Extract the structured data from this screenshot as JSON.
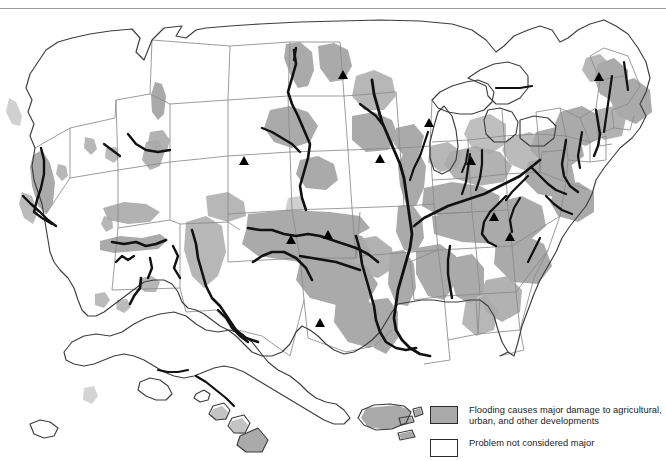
{
  "figure": {
    "title_rule": true,
    "background_color": "#ffffff",
    "flood_fill_color": "#aaaaaa",
    "state_line_color": "#808080",
    "coast_line_color": "#3a3a3a",
    "river_color": "#111111",
    "marker_color": "#000000"
  },
  "legend": {
    "items": [
      {
        "swatch": "filled",
        "color": "#aaaaaa",
        "label": "Flooding causes major damage to agricultural,\nurban, and other developments"
      },
      {
        "swatch": "empty",
        "color": "#ffffff",
        "label": "Problem not considered major"
      }
    ]
  },
  "map": {
    "projection_note": "conterminous United States with Alaska, Hawaii and Puerto Rico insets",
    "insets": [
      "Alaska",
      "Hawaii",
      "Puerto Rico and Virgin Islands"
    ],
    "marker_symbol": "triangle",
    "marker_count": 11
  }
}
